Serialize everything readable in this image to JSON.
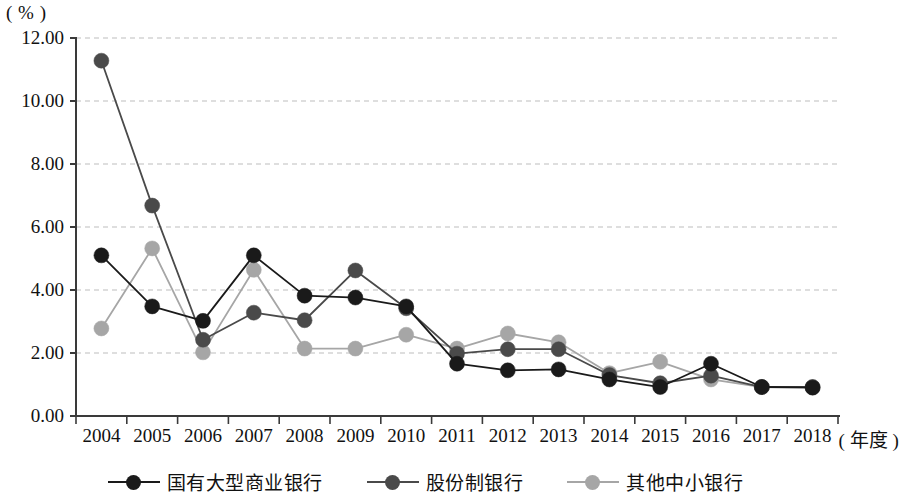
{
  "chart_data": {
    "type": "line",
    "title": "",
    "subtitle": "",
    "xlabel": "( 年度 )",
    "ylabel": "( % )",
    "ylim": [
      0.0,
      12.0
    ],
    "ytick_step": 2.0,
    "ytick_labels": [
      "0.00",
      "2.00",
      "4.00",
      "6.00",
      "8.00",
      "10.00",
      "12.00"
    ],
    "ytick_values": [
      0.0,
      2.0,
      4.0,
      6.0,
      8.0,
      10.0,
      12.0
    ],
    "grid": true,
    "grid_style": "dashed-horizontal",
    "legend_position": "bottom-center",
    "categories": [
      "2004",
      "2005",
      "2006",
      "2007",
      "2008",
      "2009",
      "2010",
      "2011",
      "2012",
      "2013",
      "2014",
      "2015",
      "2016",
      "2017",
      "2018"
    ],
    "x": [
      2004,
      2005,
      2006,
      2007,
      2008,
      2009,
      2010,
      2011,
      2012,
      2013,
      2014,
      2015,
      2016,
      2017,
      2018
    ],
    "series": [
      {
        "name": "国有大型商业银行",
        "color": "#1a1a1a",
        "marker": "circle",
        "values": [
          5.1,
          3.48,
          3.02,
          5.1,
          3.82,
          3.76,
          3.48,
          1.66,
          1.45,
          1.48,
          1.16,
          0.92,
          1.66,
          0.92,
          0.9
        ]
      },
      {
        "name": "股份制银行",
        "color": "#4a4a4a",
        "marker": "circle",
        "values": [
          11.28,
          6.68,
          2.42,
          3.28,
          3.04,
          4.62,
          3.42,
          1.98,
          2.12,
          2.12,
          1.3,
          1.04,
          1.28,
          0.92,
          0.92
        ]
      },
      {
        "name": "其他中小银行",
        "color": "#a6a6a6",
        "marker": "circle",
        "values": [
          2.78,
          5.32,
          2.02,
          4.64,
          2.14,
          2.14,
          2.58,
          2.14,
          2.62,
          2.34,
          1.36,
          1.72,
          1.16,
          0.92,
          0.92
        ]
      }
    ],
    "annotations": []
  },
  "axis": {
    "y_unit_label": "( % )",
    "x_unit_label": "( 年度 )"
  },
  "legend": {
    "items": [
      {
        "label": "国有大型商业银行",
        "color": "#1a1a1a"
      },
      {
        "label": "股份制银行",
        "color": "#4a4a4a"
      },
      {
        "label": "其他中小银行",
        "color": "#a6a6a6"
      }
    ]
  },
  "colors": {
    "series_1": "#1a1a1a",
    "series_2": "#4a4a4a",
    "series_3": "#a6a6a6",
    "grid": "#bdbdbd",
    "axis": "#3a3a3a",
    "background": "#ffffff"
  }
}
